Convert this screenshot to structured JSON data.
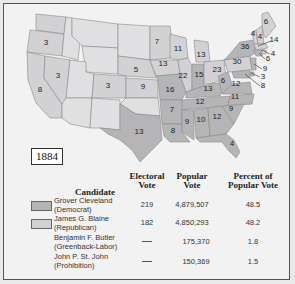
{
  "title": "1884",
  "colors": {
    "democrat": "#b5b5b8",
    "republican": "#d2d2d4",
    "background": "#f2f2f2",
    "border": "#555555"
  },
  "map": {
    "state_labels": [
      {
        "value": "3",
        "x": 46,
        "y": 45
      },
      {
        "value": "3",
        "x": 58,
        "y": 78
      },
      {
        "value": "8",
        "x": 40,
        "y": 92
      },
      {
        "value": "3",
        "x": 108,
        "y": 88
      },
      {
        "value": "5",
        "x": 136,
        "y": 72
      },
      {
        "value": "9",
        "x": 143,
        "y": 89
      },
      {
        "value": "13",
        "x": 139,
        "y": 134
      },
      {
        "value": "7",
        "x": 157,
        "y": 44
      },
      {
        "value": "11",
        "x": 178,
        "y": 51
      },
      {
        "value": "13",
        "x": 201,
        "y": 57
      },
      {
        "value": "13",
        "x": 163,
        "y": 66
      },
      {
        "value": "22",
        "x": 183,
        "y": 78
      },
      {
        "value": "15",
        "x": 199,
        "y": 77
      },
      {
        "value": "23",
        "x": 217,
        "y": 72
      },
      {
        "value": "16",
        "x": 170,
        "y": 92
      },
      {
        "value": "13",
        "x": 208,
        "y": 91
      },
      {
        "value": "6",
        "x": 223,
        "y": 83
      },
      {
        "value": "12",
        "x": 236,
        "y": 86
      },
      {
        "value": "12",
        "x": 200,
        "y": 104
      },
      {
        "value": "11",
        "x": 235,
        "y": 99
      },
      {
        "value": "7",
        "x": 172,
        "y": 112
      },
      {
        "value": "9",
        "x": 231,
        "y": 111
      },
      {
        "value": "9",
        "x": 187,
        "y": 124
      },
      {
        "value": "10",
        "x": 201,
        "y": 122
      },
      {
        "value": "12",
        "x": 217,
        "y": 119
      },
      {
        "value": "8",
        "x": 173,
        "y": 133
      },
      {
        "value": "4",
        "x": 232,
        "y": 146
      },
      {
        "value": "30",
        "x": 237,
        "y": 64
      },
      {
        "value": "36",
        "x": 245,
        "y": 49
      },
      {
        "value": "4",
        "x": 253,
        "y": 36
      },
      {
        "value": "4",
        "x": 260,
        "y": 39
      },
      {
        "value": "6",
        "x": 266,
        "y": 24
      }
    ],
    "callouts": [
      {
        "value": "14",
        "x": 274,
        "y": 42
      },
      {
        "value": "4",
        "x": 273,
        "y": 56
      },
      {
        "value": "6",
        "x": 268,
        "y": 61
      },
      {
        "value": "9",
        "x": 265,
        "y": 71
      },
      {
        "value": "3",
        "x": 263,
        "y": 79
      },
      {
        "value": "8",
        "x": 263,
        "y": 88
      }
    ]
  },
  "table": {
    "headers": {
      "candidate": "Candidate",
      "electoral_1": "Electoral",
      "electoral_2": "Vote",
      "popular_1": "Popular",
      "popular_2": "Vote",
      "percent_1": "Percent of",
      "percent_2": "Popular Vote"
    },
    "rows": [
      {
        "name": "Grover Cleveland",
        "party": "(Democrat)",
        "electoral": "219",
        "popular": "4,879,507",
        "percent": "48.5",
        "swatch": "democrat"
      },
      {
        "name": "James G. Blaine",
        "party": "(Republican)",
        "electoral": "182",
        "popular": "4,850,293",
        "percent": "48.2",
        "swatch": "republican"
      },
      {
        "name": "Benjamin F. Butler",
        "party": "(Greenback-Labor)",
        "electoral": "—",
        "popular": "175,370",
        "percent": "1.8",
        "swatch": null
      },
      {
        "name": "John P. St. John",
        "party": "(Prohibition)",
        "electoral": "—",
        "popular": "150,369",
        "percent": "1.5",
        "swatch": null
      }
    ]
  }
}
